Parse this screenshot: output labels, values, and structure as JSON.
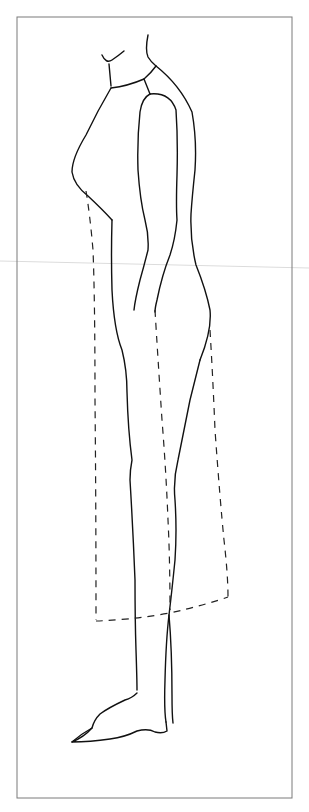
{
  "figure": {
    "title": "Side view fashion croquis with dashed shift dress outline",
    "frame": {
      "x": 17,
      "y": 17,
      "width": 275,
      "height": 781,
      "stroke": "#7a7a7a"
    },
    "colors": {
      "background": "#ffffff",
      "body_line": "#111111",
      "dress_dash": "#222222",
      "guide_line": "#dcdcdc"
    },
    "elements": [
      {
        "name": "body-silhouette",
        "style": "solid"
      },
      {
        "name": "arm",
        "style": "solid"
      },
      {
        "name": "dress-outline",
        "style": "dashed"
      },
      {
        "name": "horizontal-guide",
        "style": "faint"
      }
    ]
  }
}
